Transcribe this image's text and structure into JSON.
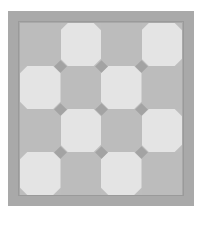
{
  "image": {
    "subject": "square tile floor pattern",
    "grid": {
      "rows": 4,
      "cols": 4
    },
    "pattern": [
      [
        "dark",
        "light",
        "dark",
        "light"
      ],
      [
        "light",
        "dark",
        "light",
        "dark"
      ],
      [
        "dark",
        "light",
        "dark",
        "light"
      ],
      [
        "light",
        "dark",
        "light",
        "dark"
      ]
    ],
    "colors": {
      "border": "#a9a9a9",
      "dark_tile": "#bcbcbc",
      "light_tile": "#e4e4e4",
      "diamond_inset": "#a3a3a3",
      "background": "#ffffff"
    }
  }
}
